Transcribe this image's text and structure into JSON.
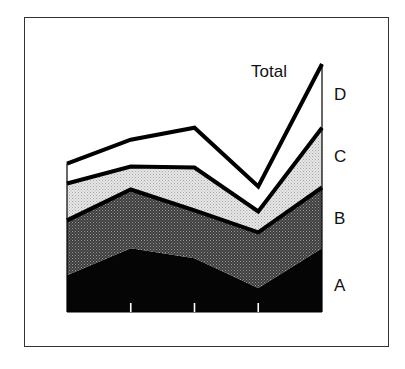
{
  "chart_data": {
    "type": "area",
    "stacked": true,
    "title": "",
    "xlabel": "",
    "ylabel": "",
    "x": [
      1,
      2,
      3,
      4,
      5
    ],
    "categories": [
      "",
      "",
      "",
      "",
      ""
    ],
    "ylim": [
      0,
      250
    ],
    "grid": false,
    "legend": "right-inline",
    "series": [
      {
        "name": "A",
        "fill": "#050505",
        "values": [
          37,
          64,
          54,
          24,
          64
        ]
      },
      {
        "name": "B",
        "fill": "#4a4a4a",
        "values": [
          55,
          59,
          48,
          56,
          61
        ]
      },
      {
        "name": "C",
        "fill": "#d8d8d8",
        "values": [
          37,
          23,
          43,
          21,
          60
        ]
      },
      {
        "name": "D",
        "fill": "#ffffff",
        "values": [
          20,
          27,
          40,
          25,
          64
        ]
      }
    ],
    "total_label": "Total",
    "total_values": [
      149,
      173,
      185,
      126,
      249
    ]
  }
}
